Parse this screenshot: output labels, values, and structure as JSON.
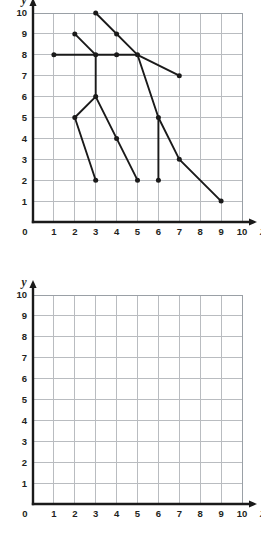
{
  "figure": {
    "kind": "coordinate-grid-worksheet",
    "panel_count": 2
  },
  "axes": {
    "x_label": "x",
    "y_label": "y",
    "x_ticks": [
      "0",
      "1",
      "2",
      "3",
      "4",
      "5",
      "6",
      "7",
      "8",
      "9",
      "10"
    ],
    "y_ticks": [
      "0",
      "1",
      "2",
      "3",
      "4",
      "5",
      "6",
      "7",
      "8",
      "9",
      "10"
    ],
    "origin_label": "0",
    "xlim": [
      0,
      10
    ],
    "ylim": [
      0,
      10
    ],
    "grid": "on",
    "grid_color": "#b9bcc0",
    "axis_color": "#1a1a1a"
  },
  "panels": [
    {
      "id": "top-panel",
      "name": "figure-with-segments",
      "empty": false
    },
    {
      "id": "bottom-panel",
      "name": "blank-grid",
      "empty": true
    }
  ],
  "chart_data": {
    "type": "scatter",
    "title": "",
    "xlabel": "x",
    "ylabel": "y",
    "xlim": [
      0,
      10
    ],
    "ylim": [
      0,
      10
    ],
    "grid": true,
    "legend": "none",
    "panels": [
      {
        "name": "top-panel",
        "points": [
          [
            1,
            8
          ],
          [
            2,
            9
          ],
          [
            3,
            10
          ],
          [
            3,
            8
          ],
          [
            3,
            6
          ],
          [
            3,
            2
          ],
          [
            4,
            9
          ],
          [
            4,
            8
          ],
          [
            4,
            4
          ],
          [
            5,
            8
          ],
          [
            5,
            2
          ],
          [
            2,
            5
          ],
          [
            6,
            5
          ],
          [
            6,
            2
          ],
          [
            7,
            7
          ],
          [
            7,
            3
          ],
          [
            9,
            1
          ]
        ],
        "segments": [
          {
            "name": "horizontal-arm",
            "path": [
              [
                1,
                8
              ],
              [
                5,
                8
              ]
            ]
          },
          {
            "name": "upper-left-diagonal",
            "path": [
              [
                2,
                9
              ],
              [
                3,
                8
              ]
            ]
          },
          {
            "name": "long-descending-arm",
            "path": [
              [
                3,
                10
              ],
              [
                5,
                8
              ],
              [
                7,
                7
              ]
            ]
          },
          {
            "name": "vertical-body",
            "path": [
              [
                3,
                8
              ],
              [
                3,
                6
              ]
            ]
          },
          {
            "name": "left-leg",
            "path": [
              [
                3,
                6
              ],
              [
                2,
                5
              ],
              [
                3,
                2
              ]
            ]
          },
          {
            "name": "middle-leg",
            "path": [
              [
                3,
                6
              ],
              [
                4,
                4
              ],
              [
                5,
                2
              ]
            ]
          },
          {
            "name": "right-descending-line",
            "path": [
              [
                5,
                8
              ],
              [
                6,
                5
              ],
              [
                7,
                3
              ],
              [
                9,
                1
              ]
            ]
          },
          {
            "name": "right-vertical-leg",
            "path": [
              [
                6,
                5
              ],
              [
                6,
                2
              ]
            ]
          }
        ]
      },
      {
        "name": "bottom-panel",
        "points": [],
        "segments": []
      }
    ]
  }
}
